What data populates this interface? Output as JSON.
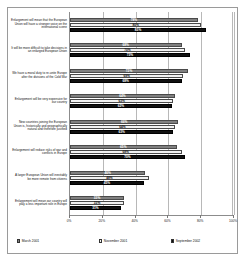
{
  "chart_data": {
    "type": "bar",
    "orientation": "horizontal",
    "title": "",
    "xlabel": "",
    "ylabel": "",
    "xlim": [
      0,
      100
    ],
    "xticks": [
      "0%",
      "20%",
      "40%",
      "60%",
      "80%",
      "100%"
    ],
    "xtick_values": [
      0,
      20,
      40,
      60,
      80,
      100
    ],
    "grid": true,
    "legend_position": "bottom",
    "categories": [
      "Enlargement will mean that the European Union will have a stronger voice on the international scene",
      "It will be more difficult to take decisions in an enlarged European Union",
      "We have a moral duty to re-unite Europe after the divisions of the Cold War",
      "Enlargement will be very expensive for our country",
      "New countries joining the European Union is, historically and geographically natural and therefore justified",
      "Enlargement will reduce risks of war and conflicts in Europe",
      "A larger European Union will inevitably be more remote from citizens",
      "Enlargement will mean our country will play a less important role in Europe"
    ],
    "series": [
      {
        "name": "March 2001",
        "color": "#808080",
        "values": [
          78,
          68,
          72,
          64,
          66,
          65,
          46,
          33
        ],
        "labels": [
          "78%",
          "68%",
          "72%",
          "64%",
          "66%",
          "65%",
          "46%",
          "33%"
        ]
      },
      {
        "name": "November 2001",
        "color": "#f2f2f2",
        "values": [
          80,
          70,
          69,
          63,
          64,
          68,
          48,
          33
        ],
        "labels": [
          "80%",
          "70%",
          "69%",
          "63%",
          "64%",
          "68%",
          "48%",
          "33%"
        ]
      },
      {
        "name": "September 2002",
        "color": "#111111",
        "values": [
          83,
          73,
          68,
          62,
          63,
          70,
          45,
          31
        ],
        "labels": [
          "83%",
          "73%",
          "68%",
          "62%",
          "63%",
          "70%",
          "45%",
          "31%"
        ]
      }
    ]
  },
  "legend": {
    "items": [
      {
        "label": "March 2001"
      },
      {
        "label": "November 2001"
      },
      {
        "label": "September 2002"
      }
    ]
  }
}
